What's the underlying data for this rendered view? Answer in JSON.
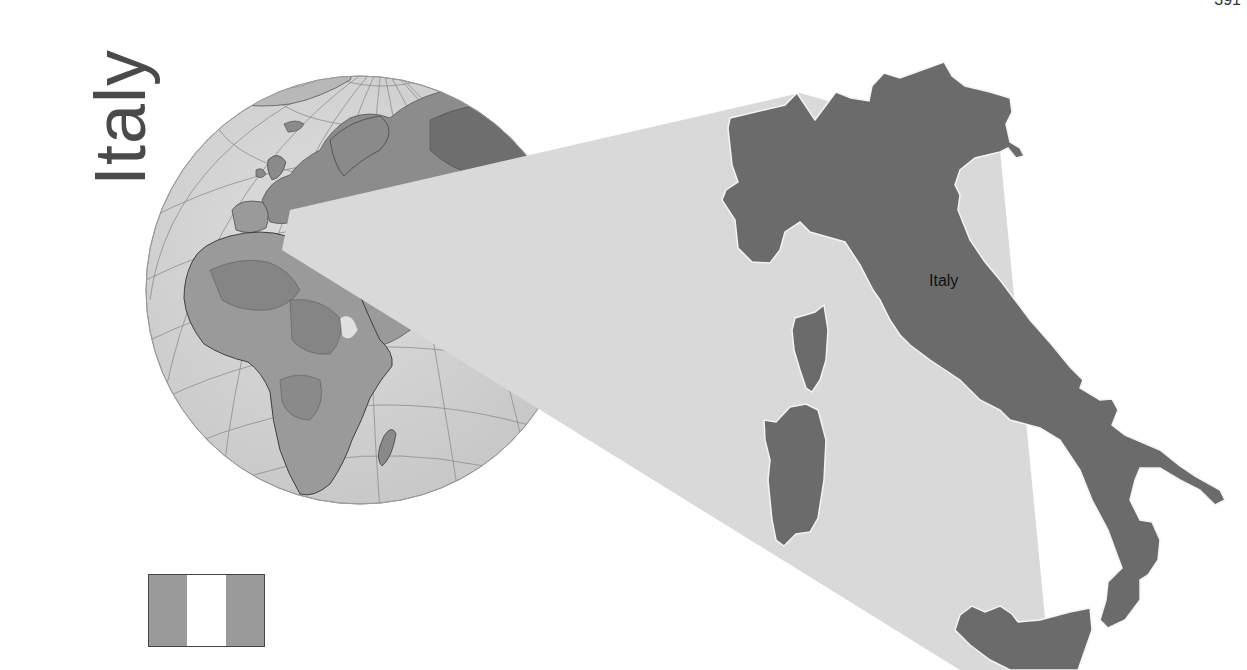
{
  "page": {
    "number": "391",
    "title": "Italy"
  },
  "map": {
    "country_label": "Italy",
    "colors": {
      "country_fill": "#6b6b6b",
      "neighbor_fill": "#d9d9d9",
      "border_stroke": "#f4f4f4",
      "ocean_globe": "#d4d4d4",
      "land_globe": "#9a9a9a",
      "land_globe_dark": "#7a7a7a",
      "graticule": "#8a8a8a"
    }
  },
  "globe": {
    "center_x": 360,
    "center_y": 290,
    "radius": 214
  },
  "flag": {
    "bands": [
      {
        "name": "left",
        "color": "#9a9a9a"
      },
      {
        "name": "center",
        "color": "#ffffff"
      },
      {
        "name": "right",
        "color": "#9a9a9a"
      }
    ]
  }
}
